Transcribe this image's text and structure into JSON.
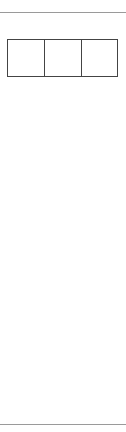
{
  "headers": [
    "h",
    "t",
    "u"
  ],
  "digits": {
    "h": 2,
    "t": 6,
    "u": 8
  },
  "rows": 9,
  "colors": {
    "shade": "#bdbdbd",
    "line": "#444444"
  }
}
